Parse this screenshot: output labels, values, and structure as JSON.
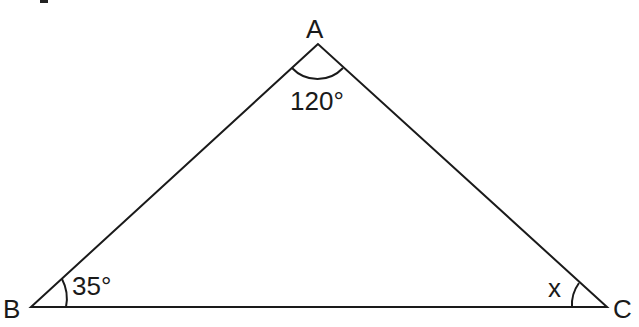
{
  "diagram": {
    "type": "triangle",
    "vertices": {
      "A": {
        "label": "A",
        "x": 318,
        "y": 44,
        "angle_label": "120°"
      },
      "B": {
        "label": "B",
        "x": 31,
        "y": 307,
        "angle_label": "35°"
      },
      "C": {
        "label": "C",
        "x": 607,
        "y": 307,
        "angle_label": "x"
      }
    },
    "colors": {
      "stroke": "#1a1a1a",
      "background": "#ffffff"
    }
  }
}
